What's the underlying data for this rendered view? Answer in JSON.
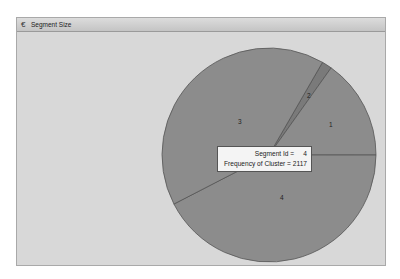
{
  "window": {
    "title": "Segment Size",
    "icon": "app-icon"
  },
  "colors": {
    "background": "#d8d8d8",
    "slice_fill": "#8c8c8c",
    "slice_outline": "#555555",
    "slice2_fill": "#7a7a7a"
  },
  "tooltip": {
    "line1_label": "Segment Id =",
    "line1_value": "4",
    "line2_label": "Frequency of Cluster =",
    "line2_value": "2117"
  },
  "chart_data": {
    "type": "pie",
    "title": "Segment Size",
    "categories": [
      "1",
      "2",
      "3",
      "4"
    ],
    "values": [
      756,
      76,
      2042,
      2117
    ],
    "value_label": "Frequency of Cluster",
    "category_label": "Segment Id",
    "start_angle_deg_clockwise_from_top": 30,
    "order_clockwise": [
      "2",
      "1",
      "4",
      "3"
    ],
    "slice_labels": [
      "1",
      "2",
      "3",
      "4"
    ],
    "highlighted": {
      "segment_id": "4",
      "frequency": 2117
    },
    "legend": "none"
  }
}
